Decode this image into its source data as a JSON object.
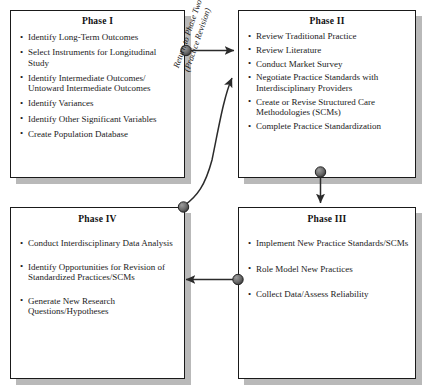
{
  "diagram": {
    "colors": {
      "box_border": "#1a1a1a",
      "box_fill": "#ffffff",
      "shadow": "#b9b9b9",
      "connector": "#2b2b2b",
      "node_fill": "#6e6e6e",
      "text": "#1a1a1a"
    },
    "phases": [
      {
        "id": "phase-1",
        "title": "Phase I",
        "items": [
          "Identify Long-Term Outcomes",
          "Select Instruments for Longitudinal Study",
          "Identify Intermediate Outcomes/ Untoward Intermediate Outcomes",
          "Identify Variances",
          "Identify Other Significant Variables",
          "Create Population Database"
        ]
      },
      {
        "id": "phase-2",
        "title": "Phase II",
        "items": [
          "Review Traditional Practice",
          "Review Literature",
          "Conduct Market Survey",
          "Negotiate Practice Standards with Interdisciplinary Providers",
          "Create or Revise Structured Care Methodologies (SCMs)",
          "Complete Practice Standardization"
        ]
      },
      {
        "id": "phase-3",
        "title": "Phase III",
        "items": [
          "Implement New Practice Standards/SCMs",
          "Role Model New Practices",
          "Collect Data/Assess Reliability"
        ]
      },
      {
        "id": "phase-4",
        "title": "Phase IV",
        "items": [
          "Conduct Interdisciplinary Data Analysis",
          "Identify Opportunities for Revision of Standardized Practices/SCMs",
          "Generate New Research Questions/Hypotheses"
        ]
      }
    ],
    "connectors": {
      "feedback_label_line1": "Return to Phase Two",
      "feedback_label_line2": "(Practice Revision)",
      "flows": [
        {
          "name": "phase-1-to-phase-2",
          "from": "Phase I",
          "to": "Phase II"
        },
        {
          "name": "phase-2-to-phase-3",
          "from": "Phase II",
          "to": "Phase III"
        },
        {
          "name": "phase-3-to-phase-4",
          "from": "Phase III",
          "to": "Phase IV"
        },
        {
          "name": "phase-4-to-phase-2",
          "from": "Phase IV",
          "to": "Phase II"
        }
      ]
    }
  }
}
